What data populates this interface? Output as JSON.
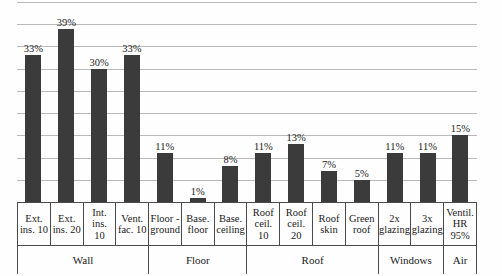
{
  "chart_data": {
    "type": "bar",
    "title": "",
    "xlabel": "",
    "ylabel": "",
    "ylim": [
      0,
      45
    ],
    "grid": true,
    "gridline_step": 5,
    "legend": "none",
    "bar_color": "#3b3b3b",
    "gridline_color": "#b9b9b9",
    "value_suffix": "%",
    "categories": [
      "Ext. ins. 10",
      "Ext. ins. 20",
      "Int. ins. 10",
      "Vent. fac. 10",
      "Floor - ground",
      "Base. floor",
      "Base. ceiling",
      "Roof ceil. 10",
      "Roof ceil. 20",
      "Roof skin",
      "Green roof",
      "2x glazing",
      "3x glazing",
      "Ventil. HR 95%"
    ],
    "values": [
      33,
      39,
      30,
      33,
      11,
      1,
      8,
      11,
      13,
      7,
      5,
      11,
      11,
      15
    ],
    "data_labels": [
      "33%",
      "39%",
      "30%",
      "33%",
      "11%",
      "1%",
      "8%",
      "11%",
      "13%",
      "7%",
      "5%",
      "11%",
      "11%",
      "15%"
    ],
    "groups": [
      {
        "label": "Wall",
        "span": 4
      },
      {
        "label": "Floor",
        "span": 3
      },
      {
        "label": "Roof",
        "span": 4
      },
      {
        "label": "Windows",
        "span": 2
      },
      {
        "label": "Air",
        "span": 1
      }
    ]
  },
  "axis_labels": {
    "category_lines": [
      [
        "Ext.",
        "ins. 10"
      ],
      [
        "Ext.",
        "ins. 20"
      ],
      [
        "Int. ins.",
        "10"
      ],
      [
        "Vent.",
        "fac. 10"
      ],
      [
        "Floor -",
        "ground"
      ],
      [
        "Base.",
        "floor"
      ],
      [
        "Base.",
        "ceiling"
      ],
      [
        "Roof",
        "ceil. 10"
      ],
      [
        "Roof",
        "ceil. 20"
      ],
      [
        "Roof",
        "skin"
      ],
      [
        "Green",
        "roof"
      ],
      [
        "2x",
        "glazing"
      ],
      [
        "3x",
        "glazing"
      ],
      [
        "Ventil.",
        "HR",
        "95%"
      ]
    ]
  }
}
